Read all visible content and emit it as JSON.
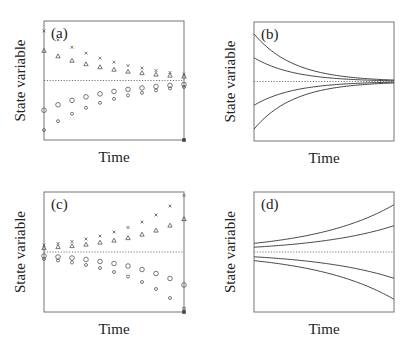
{
  "figure": {
    "axis_label_y": "State variable",
    "axis_label_x": "Time",
    "line_color": "#444444",
    "frame_color": "#777777"
  },
  "chart_data": [
    {
      "panel": "(a)",
      "type": "scatter",
      "title": "(a)",
      "xlabel": "Time",
      "ylabel": "State variable",
      "description": "Damped convergence toward equilibrium (dotted line); four discrete series approaching the equilibrium from above and below",
      "equilibrium": 0,
      "x": [
        0,
        1,
        2,
        3,
        4,
        5,
        6,
        7,
        8,
        9,
        10
      ],
      "series": [
        {
          "name": "star",
          "marker": "x",
          "values": [
            1.0,
            0.82,
            0.67,
            0.55,
            0.45,
            0.37,
            0.3,
            0.25,
            0.2,
            0.16,
            0.13
          ]
        },
        {
          "name": "triangle",
          "marker": "triangle",
          "values": [
            0.6,
            0.49,
            0.4,
            0.33,
            0.27,
            0.22,
            0.18,
            0.15,
            0.12,
            0.1,
            0.08
          ]
        },
        {
          "name": "circle",
          "marker": "circle",
          "values": [
            -0.6,
            -0.49,
            -0.4,
            -0.33,
            -0.27,
            -0.22,
            -0.18,
            -0.15,
            -0.12,
            -0.1,
            -0.08
          ]
        },
        {
          "name": "small-circle",
          "marker": "small-circle",
          "values": [
            -1.0,
            -0.82,
            -0.67,
            -0.55,
            -0.45,
            -0.37,
            -0.3,
            -0.25,
            -0.2,
            -0.16,
            -0.13
          ]
        }
      ],
      "ylim": [
        -1.2,
        1.2
      ],
      "grid": false
    },
    {
      "panel": "(b)",
      "type": "line",
      "title": "(b)",
      "xlabel": "Time",
      "ylabel": "State variable",
      "description": "Continuous exponential decay toward equilibrium from four initial values",
      "equilibrium": 0,
      "series": [
        {
          "name": "curve-1",
          "initial": 1.0,
          "rate": -0.35
        },
        {
          "name": "curve-2",
          "initial": 0.5,
          "rate": -0.35
        },
        {
          "name": "curve-3",
          "initial": -0.5,
          "rate": -0.35
        },
        {
          "name": "curve-4",
          "initial": -1.0,
          "rate": -0.35
        }
      ],
      "xlim": [
        0,
        10
      ],
      "ylim": [
        -1.25,
        1.25
      ],
      "grid": false
    },
    {
      "panel": "(c)",
      "type": "scatter",
      "title": "(c)",
      "xlabel": "Time",
      "ylabel": "State variable",
      "description": "Divergence away from equilibrium; four discrete series growing away from the dotted equilibrium line",
      "equilibrium": 0,
      "x": [
        0,
        1,
        2,
        3,
        4,
        5,
        6,
        7,
        8,
        9,
        10
      ],
      "series": [
        {
          "name": "star",
          "marker": "x",
          "values": [
            0.14,
            0.17,
            0.21,
            0.26,
            0.32,
            0.4,
            0.49,
            0.6,
            0.74,
            0.92,
            1.13
          ]
        },
        {
          "name": "triangle",
          "marker": "triangle",
          "values": [
            0.08,
            0.1,
            0.12,
            0.15,
            0.19,
            0.23,
            0.28,
            0.35,
            0.43,
            0.53,
            0.66
          ]
        },
        {
          "name": "circle",
          "marker": "circle",
          "values": [
            -0.08,
            -0.1,
            -0.12,
            -0.15,
            -0.19,
            -0.23,
            -0.28,
            -0.35,
            -0.43,
            -0.53,
            -0.66
          ]
        },
        {
          "name": "small-circle",
          "marker": "small-circle",
          "values": [
            -0.14,
            -0.17,
            -0.21,
            -0.26,
            -0.32,
            -0.4,
            -0.49,
            -0.6,
            -0.74,
            -0.92,
            -1.13
          ]
        }
      ],
      "ylim": [
        -1.2,
        1.2
      ],
      "grid": false
    },
    {
      "panel": "(d)",
      "type": "line",
      "title": "(d)",
      "xlabel": "Time",
      "ylabel": "State variable",
      "description": "Continuous exponential growth away from equilibrium from four initial values near the equilibrium",
      "equilibrium": 0,
      "series": [
        {
          "name": "curve-1",
          "initial": 0.18,
          "rate": 0.17
        },
        {
          "name": "curve-2",
          "initial": 0.1,
          "rate": 0.17
        },
        {
          "name": "curve-3",
          "initial": -0.1,
          "rate": 0.17
        },
        {
          "name": "curve-4",
          "initial": -0.18,
          "rate": 0.17
        }
      ],
      "xlim": [
        0,
        10
      ],
      "ylim": [
        -1.25,
        1.25
      ],
      "grid": false
    }
  ],
  "layout": {
    "panels": [
      {
        "x": 44,
        "y": 21,
        "w": 140,
        "h": 119
      },
      {
        "x": 254,
        "y": 22,
        "w": 140,
        "h": 119
      },
      {
        "x": 44,
        "y": 192,
        "w": 140,
        "h": 120
      },
      {
        "x": 254,
        "y": 192,
        "w": 140,
        "h": 120
      }
    ]
  }
}
